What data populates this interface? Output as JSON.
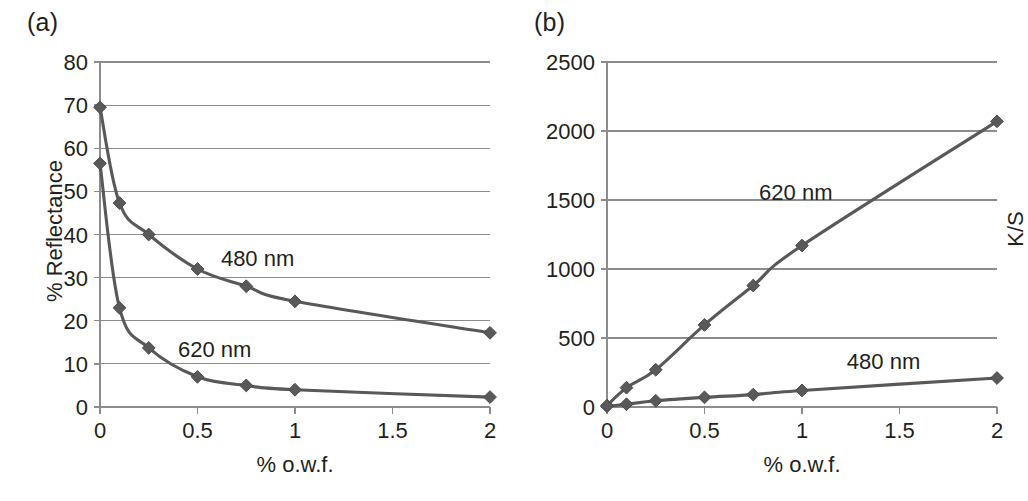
{
  "figure": {
    "background_color": "#ffffff",
    "line_color": "#595959",
    "grid_color": "#8c8c8c",
    "text_color": "#231f20"
  },
  "panels": {
    "a": {
      "panel_label": "(a)",
      "ylabel": "% Reflectance",
      "xlabel": "% o.w.f.",
      "series_label_1": "480 nm",
      "series_label_2": "620 nm",
      "yticks": [
        "0",
        "10",
        "20",
        "30",
        "40",
        "50",
        "60",
        "70",
        "80"
      ],
      "xticks": [
        "0",
        "0.5",
        "1",
        "1.5",
        "2"
      ]
    },
    "b": {
      "panel_label": "(b)",
      "ylabel": "K/S",
      "xlabel": "% o.w.f.",
      "series_label_1": "620 nm",
      "series_label_2": "480 nm",
      "yticks": [
        "0",
        "500",
        "1000",
        "1500",
        "2000",
        "2500"
      ],
      "xticks": [
        "0",
        "0.5",
        "1",
        "1.5",
        "2"
      ]
    }
  },
  "chart_data": [
    {
      "id": "a",
      "type": "line",
      "title": "(a)",
      "xlabel": "% o.w.f.",
      "ylabel": "% Reflectance",
      "xlim": [
        0,
        2
      ],
      "ylim": [
        0,
        80
      ],
      "ytick_values": [
        0,
        10,
        20,
        30,
        40,
        50,
        60,
        70,
        80
      ],
      "xtick_values": [
        0,
        0.5,
        1,
        1.5,
        2
      ],
      "grid": "horizontal",
      "legend": "inline-annotation",
      "x": [
        0,
        0.1,
        0.25,
        0.5,
        0.75,
        1,
        2
      ],
      "series": [
        {
          "name": "480 nm",
          "values": [
            69.5,
            47.3,
            40.0,
            32.0,
            28.0,
            24.5,
            17.2
          ]
        },
        {
          "name": "620 nm",
          "values": [
            56.5,
            23.0,
            13.7,
            7.0,
            5.0,
            4.0,
            2.3
          ]
        }
      ]
    },
    {
      "id": "b",
      "type": "line",
      "title": "(b)",
      "xlabel": "% o.w.f.",
      "ylabel": "K/S",
      "xlim": [
        0,
        2
      ],
      "ylim": [
        0,
        2500
      ],
      "ytick_values": [
        0,
        500,
        1000,
        1500,
        2000,
        2500
      ],
      "xtick_values": [
        0,
        0.5,
        1,
        1.5,
        2
      ],
      "grid": "horizontal",
      "legend": "inline-annotation",
      "x": [
        0,
        0.1,
        0.25,
        0.5,
        0.75,
        1,
        2
      ],
      "series": [
        {
          "name": "620 nm",
          "values": [
            10,
            140,
            270,
            595,
            880,
            1170,
            2070
          ]
        },
        {
          "name": "480 nm",
          "values": [
            5,
            20,
            45,
            70,
            90,
            120,
            210
          ]
        }
      ]
    }
  ]
}
